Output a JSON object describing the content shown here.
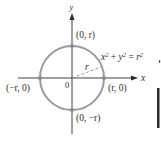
{
  "diagram": {
    "axes": {
      "x_label": "x",
      "y_label": "y",
      "origin_label": "0"
    },
    "circle": {
      "equation": {
        "x": "x",
        "x_exp": "2",
        "plus": " + ",
        "y": "y",
        "y_exp": "2",
        "eq": " = ",
        "r": "r",
        "r_exp": "2"
      },
      "radius_label": "r",
      "stroke_color": "#9a9a9a",
      "point_color": "#8a8a8a"
    },
    "points": [
      {
        "id": "top",
        "label": "(0, r)"
      },
      {
        "id": "right",
        "label": "(r, 0)"
      },
      {
        "id": "bottom",
        "label": "(0, −r)"
      },
      {
        "id": "left",
        "label": "(−r, 0)"
      }
    ],
    "colors": {
      "axis": "#2a2a2a",
      "circle": "#9a9a9a",
      "radius_dash": "#8a8a8a",
      "edge_bar": "#2a2a2a"
    }
  }
}
